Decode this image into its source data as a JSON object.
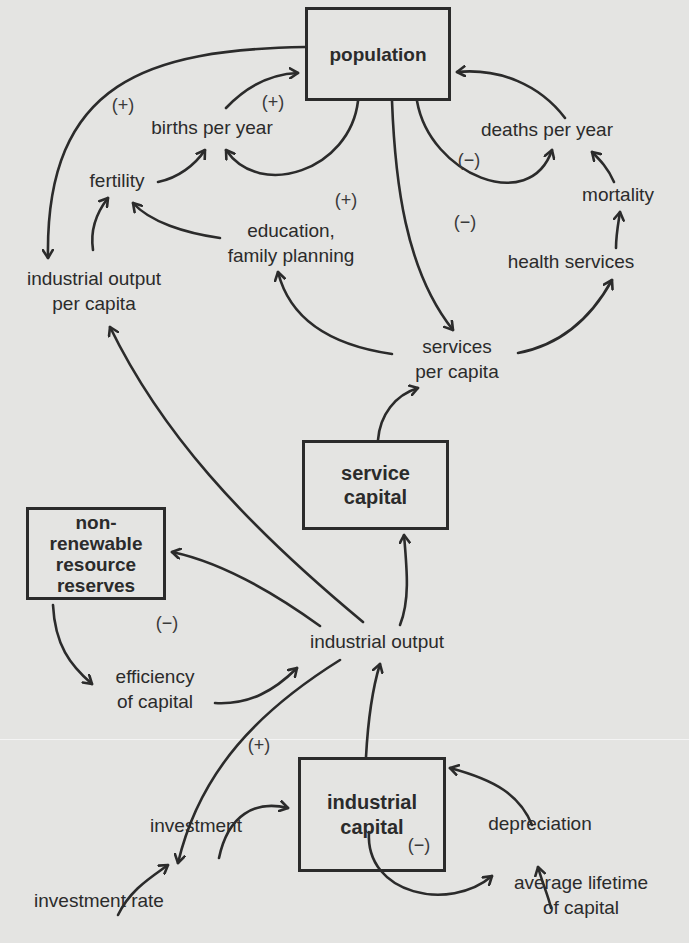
{
  "diagram": {
    "type": "causal-loop / stock-flow diagram",
    "colors": {
      "background": "#e4e4e2",
      "ink": "#2b2b2b"
    },
    "stocks": {
      "population": {
        "label": "population"
      },
      "service_capital": {
        "line1": "service",
        "line2": "capital"
      },
      "nonrenewable": {
        "line1": "non-",
        "line2": "renewable",
        "line3": "resource",
        "line4": "reserves"
      },
      "industrial_capital": {
        "line1": "industrial",
        "line2": "capital"
      }
    },
    "variables": {
      "births_per_year": "births per year",
      "deaths_per_year": "deaths per year",
      "fertility": "fertility",
      "education_line1": "education,",
      "education_line2": "family planning",
      "mortality": "mortality",
      "health_services": "health services",
      "iopc_line1": "industrial output",
      "iopc_line2": "per capita",
      "spc_line1": "services",
      "spc_line2": "per capita",
      "industrial_output": "industrial output",
      "efficiency_line1": "efficiency",
      "efficiency_line2": "of capital",
      "investment": "investment",
      "depreciation": "depreciation",
      "investment_rate": "investment rate",
      "lifetime_line1": "average lifetime",
      "lifetime_line2": "of capital"
    },
    "loop_signs": {
      "pop_iopc": "(+)",
      "births_loop": "(+)",
      "education_loop": "(+)",
      "deaths_loop": "(−)",
      "health_loop": "(−)",
      "resources_loop": "(−)",
      "investment_loop": "(+)",
      "depreciation_loop": "(−)"
    },
    "links": [
      {
        "from": "population",
        "to": "industrial output per capita"
      },
      {
        "from": "births per year",
        "to": "population"
      },
      {
        "from": "population",
        "to": "births per year"
      },
      {
        "from": "fertility",
        "to": "births per year"
      },
      {
        "from": "industrial output per capita",
        "to": "fertility"
      },
      {
        "from": "education, family planning",
        "to": "fertility"
      },
      {
        "from": "deaths per year",
        "to": "population"
      },
      {
        "from": "population",
        "to": "deaths per year"
      },
      {
        "from": "mortality",
        "to": "deaths per year"
      },
      {
        "from": "health services",
        "to": "mortality"
      },
      {
        "from": "population",
        "to": "services per capita"
      },
      {
        "from": "services per capita",
        "to": "education, family planning"
      },
      {
        "from": "services per capita",
        "to": "health services"
      },
      {
        "from": "service capital",
        "to": "services per capita"
      },
      {
        "from": "industrial output",
        "to": "service capital"
      },
      {
        "from": "industrial output",
        "to": "industrial output per capita"
      },
      {
        "from": "industrial output",
        "to": "non-renewable resource reserves"
      },
      {
        "from": "non-renewable resource reserves",
        "to": "efficiency of capital"
      },
      {
        "from": "efficiency of capital",
        "to": "industrial output"
      },
      {
        "from": "industrial capital",
        "to": "industrial output"
      },
      {
        "from": "industrial output",
        "to": "investment"
      },
      {
        "from": "investment",
        "to": "industrial capital"
      },
      {
        "from": "investment rate",
        "to": "investment"
      },
      {
        "from": "industrial capital",
        "to": "depreciation"
      },
      {
        "from": "depreciation",
        "to": "industrial capital"
      },
      {
        "from": "average lifetime of capital",
        "to": "depreciation"
      }
    ]
  }
}
